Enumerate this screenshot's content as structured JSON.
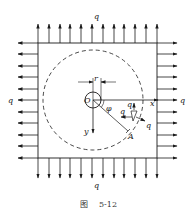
{
  "figure": {
    "caption_prefix": "图",
    "caption_number": "5-12",
    "labels": {
      "q_top": "q",
      "q_bottom": "q",
      "q_left": "q",
      "q_right": "q",
      "origin": "O",
      "radius": "r",
      "x_axis": "x",
      "y_axis": "y",
      "angle": "φ",
      "point": "A",
      "q_element_top": "q",
      "q_element_left": "q",
      "q_element_right": "q"
    },
    "colors": {
      "line": "#1a1a1a",
      "background": "#ffffff"
    }
  }
}
